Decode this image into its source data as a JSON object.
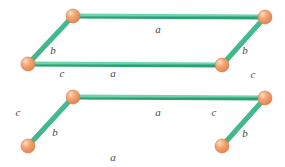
{
  "figure": {
    "kind": "geometry-diagram",
    "shape_name": "rectangular-prism",
    "background_color": "#ffffff"
  },
  "style": {
    "edge_color": "#3fbf8f",
    "edge_highlight_color": "#86d9b8",
    "edge_shadow_color": "#2a9e74",
    "vertex_color": "#f0935c",
    "vertex_highlight_color": "#fbd2b0",
    "vertex_edge_color": "#d9794a",
    "label_color": "#4a4a4a",
    "edge_width": 5,
    "vertex_radius": 7
  },
  "vertices": [
    {
      "id": "back-top-left",
      "name": "vertex-back-top-left",
      "x": 73,
      "y": 16
    },
    {
      "id": "back-top-right",
      "name": "vertex-back-top-right",
      "x": 265,
      "y": 17
    },
    {
      "id": "front-top-left",
      "name": "vertex-front-top-left",
      "x": 28,
      "y": 64
    },
    {
      "id": "front-top-right",
      "name": "vertex-front-top-right",
      "x": 222,
      "y": 65
    },
    {
      "id": "back-bottom-left",
      "name": "vertex-back-bottom-left",
      "x": 73,
      "y": 97
    },
    {
      "id": "back-bottom-right",
      "name": "vertex-back-bottom-right",
      "x": 265,
      "y": 98
    },
    {
      "id": "front-bottom-left",
      "name": "vertex-front-bottom-left",
      "x": 28,
      "y": 146
    },
    {
      "id": "front-bottom-right",
      "name": "vertex-front-bottom-right",
      "x": 222,
      "y": 146
    }
  ],
  "edges": [
    {
      "id": "top-back",
      "name": "edge-top-back",
      "from": "back-top-left",
      "to": "back-top-right",
      "label": "a"
    },
    {
      "id": "top-front",
      "name": "edge-top-front",
      "from": "front-top-left",
      "to": "front-top-right",
      "label": "a"
    },
    {
      "id": "bottom-back",
      "name": "edge-bottom-back",
      "from": "back-bottom-left",
      "to": "back-bottom-right",
      "label": "a"
    },
    {
      "id": "bottom-front",
      "name": "edge-bottom-front",
      "from": "front-bottom-left",
      "to": "front-bottom-right",
      "label": "a"
    },
    {
      "id": "depth-top-left",
      "name": "edge-depth-top-left",
      "from": "front-top-left",
      "to": "back-top-left",
      "label": "b"
    },
    {
      "id": "depth-top-right",
      "name": "edge-depth-top-right",
      "from": "front-top-right",
      "to": "back-top-right",
      "label": "b"
    },
    {
      "id": "depth-bottom-left",
      "name": "edge-depth-bottom-left",
      "from": "front-bottom-left",
      "to": "back-bottom-left",
      "label": "b"
    },
    {
      "id": "depth-bottom-right",
      "name": "edge-depth-bottom-right",
      "from": "front-bottom-right",
      "to": "back-bottom-right",
      "label": "b"
    },
    {
      "id": "height-back-left",
      "name": "edge-height-back-left",
      "from": "back-top-left",
      "to": "back-bottom-left",
      "label": "c"
    },
    {
      "id": "height-back-right",
      "name": "edge-height-back-right",
      "from": "back-top-right",
      "to": "back-bottom-right",
      "label": "c"
    },
    {
      "id": "height-front-left",
      "name": "edge-height-front-left",
      "from": "front-top-left",
      "to": "front-bottom-left",
      "label": "c"
    },
    {
      "id": "height-front-right",
      "name": "edge-height-front-right",
      "from": "front-top-right",
      "to": "front-bottom-right",
      "label": "c"
    }
  ],
  "labels": [
    {
      "id": "label-a-top",
      "name": "edge-label-a-top",
      "text": "a",
      "x": 158,
      "y": 29
    },
    {
      "id": "label-a-middle",
      "name": "edge-label-a-middle",
      "text": "a",
      "x": 113,
      "y": 73
    },
    {
      "id": "label-a-lower-middle",
      "name": "edge-label-a-lower-middle",
      "text": "a",
      "x": 158,
      "y": 112
    },
    {
      "id": "label-a-bottom",
      "name": "edge-label-a-bottom",
      "text": "a",
      "x": 113,
      "y": 157
    },
    {
      "id": "label-b-top-left",
      "name": "edge-label-b-top-left",
      "text": "b",
      "x": 53,
      "y": 50
    },
    {
      "id": "label-b-top-right",
      "name": "edge-label-b-top-right",
      "text": "b",
      "x": 245,
      "y": 50
    },
    {
      "id": "label-b-bottom-left",
      "name": "edge-label-b-bottom-left",
      "text": "b",
      "x": 55,
      "y": 132
    },
    {
      "id": "label-b-bottom-right",
      "name": "edge-label-b-bottom-right",
      "text": "b",
      "x": 245,
      "y": 133
    },
    {
      "id": "label-c-inner-left",
      "name": "edge-label-c-inner-left",
      "text": "c",
      "x": 62,
      "y": 73
    },
    {
      "id": "label-c-outer-left",
      "name": "edge-label-c-outer-left",
      "text": "c",
      "x": 18,
      "y": 112
    },
    {
      "id": "label-c-outer-right",
      "name": "edge-label-c-outer-right",
      "text": "c",
      "x": 253,
      "y": 74
    },
    {
      "id": "label-c-inner-right",
      "name": "edge-label-c-inner-right",
      "text": "c",
      "x": 214,
      "y": 112
    }
  ]
}
